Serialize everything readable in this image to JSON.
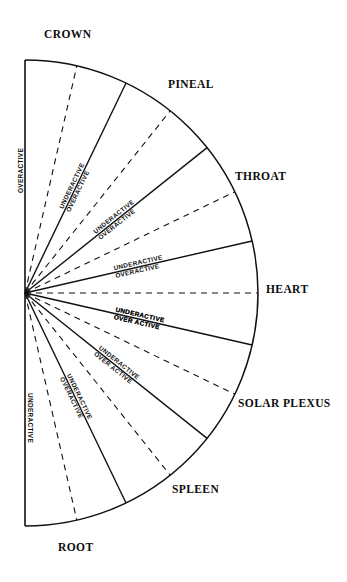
{
  "geometry": {
    "center_x": 25,
    "center_y": 293,
    "radius": 233,
    "start_angle_deg": -90,
    "end_angle_deg": 90
  },
  "chart_data": {
    "type": "pie",
    "subtype": "semicircular-dowsing-dial",
    "xlabel": "",
    "ylabel": "",
    "legend_position": "none",
    "grid": false,
    "total_sweep_deg": 180,
    "sector_count": 7,
    "categories": [
      "CROWN",
      "PINEAL",
      "THROAT",
      "HEART",
      "SOLAR PLEXUS",
      "SPLEEN",
      "ROOT"
    ],
    "values": [
      25.7,
      25.7,
      25.7,
      25.7,
      25.7,
      25.7,
      25.7
    ],
    "sectors": [
      {
        "name": "CROWN",
        "start_deg": -90.0,
        "end_deg": -64.3,
        "mid_deg": -77.15
      },
      {
        "name": "PINEAL",
        "start_deg": -64.3,
        "end_deg": -38.6,
        "mid_deg": -51.45
      },
      {
        "name": "THROAT",
        "start_deg": -38.6,
        "end_deg": -12.9,
        "mid_deg": -25.75
      },
      {
        "name": "HEART",
        "start_deg": -12.9,
        "end_deg": 12.9,
        "mid_deg": 0.0
      },
      {
        "name": "SOLAR PLEXUS",
        "start_deg": 12.9,
        "end_deg": 38.6,
        "mid_deg": 25.75
      },
      {
        "name": "SPLEEN",
        "start_deg": 38.6,
        "end_deg": 64.3,
        "mid_deg": 51.45
      },
      {
        "name": "ROOT",
        "start_deg": 64.3,
        "end_deg": 90.0,
        "mid_deg": 77.15
      }
    ],
    "annotations": [
      "UNDERACTIVE",
      "OVER ACTIVE",
      "OVERACTIVE"
    ]
  },
  "labels": {
    "crown": "CROWN",
    "pineal": "PINEAL",
    "throat": "THROAT",
    "heart": "HEART",
    "solar_plexus": "SOLAR PLEXUS",
    "spleen": "SPLEEN",
    "root": "ROOT"
  },
  "radial_labels": {
    "overactive": "OVERACTIVE",
    "underactive": "UNDERACTIVE",
    "over_active_spaced": "OVER ACTIVE",
    "pairs": [
      {
        "sector": "CROWN",
        "upper": "UNDERACTIVE",
        "lower": "OVERACTIVE"
      },
      {
        "sector": "PINEAL",
        "upper": "UNDERACTIVE",
        "lower": "OVERACTIVE"
      },
      {
        "sector": "THROAT",
        "upper": "UNDERACTIVE",
        "lower": "OVERACTIVE"
      },
      {
        "sector": "HEART-UPPER",
        "upper": "UNDERACTIVE",
        "lower": "OVER ACTIVE"
      },
      {
        "sector": "HEART-LOWER",
        "upper": "UNDERACTIVE",
        "lower": "OVER ACTIVE"
      },
      {
        "sector": "SOLAR PLEXUS",
        "upper": "UNDERACTIVE",
        "lower": "OVERACTIVE"
      },
      {
        "sector": "SPLEEN",
        "upper": "UNDERACTIVE",
        "lower": "OVER ACTIVE"
      }
    ],
    "top_edge": "OVERACTIVE",
    "bottom_edge": "UNDERACTIVE"
  },
  "colors": {
    "stroke": "#111111",
    "background": "#ffffff",
    "text": "#0d0d0d"
  }
}
